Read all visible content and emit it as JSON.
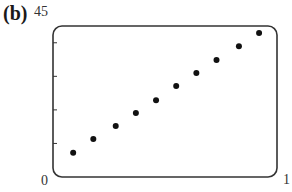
{
  "panel_label": "(b)",
  "axes": {
    "y_max_label": "45",
    "x_min_label": "0",
    "x_max_label": "1"
  },
  "chart_data": {
    "type": "scatter",
    "title": "",
    "xlabel": "",
    "ylabel": "",
    "xlim": [
      0,
      1
    ],
    "ylim": [
      0,
      45
    ],
    "y_ticks": [
      10,
      20,
      30,
      40
    ],
    "grid": false,
    "legend": null,
    "x": [
      0.09,
      0.18,
      0.28,
      0.37,
      0.46,
      0.55,
      0.64,
      0.73,
      0.83,
      0.92
    ],
    "y": [
      7.2,
      11.3,
      15.2,
      19.1,
      22.9,
      27.1,
      31.0,
      34.9,
      39.0,
      42.9
    ]
  },
  "colors": {
    "frame": "#333333",
    "points": "#111111"
  }
}
